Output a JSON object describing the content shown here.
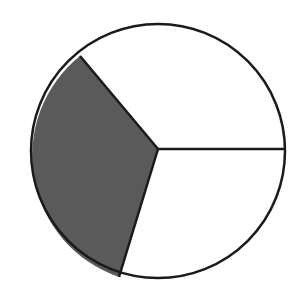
{
  "diagram": {
    "type": "pie-fraction",
    "colors": {
      "background": "#ffffff",
      "shaded": "#5a5a5a",
      "unshaded": "#ffffff",
      "outline": "#1a1a1a"
    },
    "sectors": [
      {
        "name": "upper-right",
        "start_deg": 0,
        "end_deg": 130,
        "shaded": false
      },
      {
        "name": "left",
        "start_deg": 130,
        "end_deg": 253,
        "shaded": true
      },
      {
        "name": "lower-right",
        "start_deg": 253,
        "end_deg": 360,
        "shaded": false
      }
    ],
    "shaded_count": 1,
    "total_sectors": 3
  }
}
